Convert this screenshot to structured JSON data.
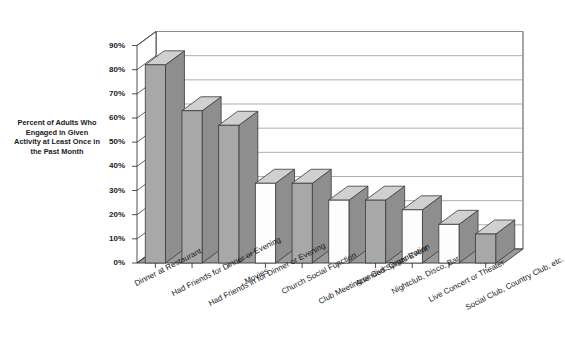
{
  "chart_data": {
    "type": "bar",
    "title": "",
    "xlabel": "",
    "ylabel": "Percent of Adults Who Engaged in Given Activity at Least Once in the Past Month",
    "ylim": [
      0,
      90
    ],
    "ytick_labels": [
      "0%",
      "10%",
      "20%",
      "30%",
      "40%",
      "50%",
      "60%",
      "70%",
      "80%",
      "90%"
    ],
    "ytick_values": [
      0,
      10,
      20,
      30,
      40,
      50,
      60,
      70,
      80,
      90
    ],
    "grid": true,
    "legend": "none",
    "style": "3d-column",
    "categories": [
      "Dinner at  Restaurant",
      "Had Friends for Dinner or Evening",
      "Had Friends in for Dinner or Evening",
      "Movies",
      "Church Social Function",
      "Club Meeting or Civic Organization",
      "Attended Sports Event",
      "Nightclub, Disco, Bar",
      "Live Concert or Theater",
      "Social Club, Country Club, etc."
    ],
    "values": [
      82,
      63,
      57,
      33,
      33,
      26,
      26,
      22,
      16,
      12
    ],
    "bar_fills": [
      "gray",
      "gray",
      "gray",
      "white",
      "gray",
      "white",
      "gray",
      "white",
      "white",
      "gray"
    ]
  },
  "axis_title_lines": [
    "Percent of Adults Who",
    "Engaged in Given",
    "Activity at Least Once in",
    "the Past Month"
  ],
  "colors": {
    "bar_gray": "#a8a8a8",
    "bar_white": "#fdfdfd",
    "bar_top": "#d0d0d0",
    "bar_side": "#8e8e8e",
    "floor": "#9a9a9a",
    "outline": "#3a3a3a",
    "grid": "#9b9b9b",
    "text": "#1a1a1a"
  }
}
